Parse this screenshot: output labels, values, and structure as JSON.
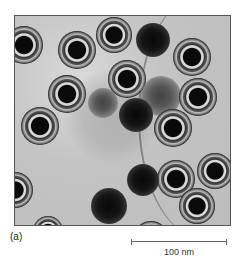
{
  "figure": {
    "panel_label": "(a)",
    "image_description": "Transmission electron micrograph showing spherical virus particles with concentric ring structures and dark cores",
    "scale_bar": {
      "label": "100 nm",
      "length_px": 96
    },
    "colors": {
      "background": "#ffffff",
      "micrograph_base": "#c4c4c4",
      "particle_core": "#0a0a0a"
    },
    "particles": [
      {
        "type": "ringed",
        "x": -10,
        "y": 10,
        "d": 38
      },
      {
        "type": "ringed",
        "x": 43,
        "y": 15,
        "d": 38
      },
      {
        "type": "ringed",
        "x": 81,
        "y": 1,
        "d": 36
      },
      {
        "type": "dark",
        "x": 121,
        "y": 7,
        "d": 34
      },
      {
        "type": "ringed",
        "x": 158,
        "y": 22,
        "d": 38
      },
      {
        "type": "ringed",
        "x": 93,
        "y": 44,
        "d": 38
      },
      {
        "type": "ringed",
        "x": 33,
        "y": 59,
        "d": 38
      },
      {
        "type": "fuzzy",
        "x": 73,
        "y": 72,
        "d": 30
      },
      {
        "type": "fuzzy",
        "x": 126,
        "y": 60,
        "d": 40
      },
      {
        "type": "ringed",
        "x": 164,
        "y": 62,
        "d": 38
      },
      {
        "type": "dark",
        "x": 104,
        "y": 82,
        "d": 34
      },
      {
        "type": "ringed",
        "x": 6,
        "y": 91,
        "d": 38
      },
      {
        "type": "ringed",
        "x": 139,
        "y": 93,
        "d": 38
      },
      {
        "type": "ringed",
        "x": 142,
        "y": 144,
        "d": 38
      },
      {
        "type": "ringed",
        "x": 182,
        "y": 137,
        "d": 36
      },
      {
        "type": "ringed",
        "x": 164,
        "y": 172,
        "d": 36
      },
      {
        "type": "dark",
        "x": 112,
        "y": 148,
        "d": 32
      },
      {
        "type": "dark",
        "x": 76,
        "y": 172,
        "d": 36
      },
      {
        "type": "ringed",
        "x": -18,
        "y": 156,
        "d": 36
      },
      {
        "type": "ringed",
        "x": 118,
        "y": 205,
        "d": 36
      },
      {
        "type": "ringed",
        "x": 18,
        "y": 200,
        "d": 30
      }
    ]
  }
}
